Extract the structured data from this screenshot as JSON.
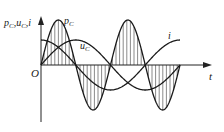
{
  "figure": {
    "y_axis_label": "p",
    "y_axis_label_sub1": "C",
    "y_axis_label_sep1": ",",
    "y_axis_label_u": "u",
    "y_axis_label_sub2": "C",
    "y_axis_label_sep2": ",",
    "y_axis_label_i": "i",
    "x_axis_label": "t",
    "origin_label": "O",
    "curve_labels": {
      "pc_main": "p",
      "pc_sub": "C",
      "uc_main": "u",
      "uc_sub": "C",
      "i": "i"
    },
    "colors": {
      "line": "#1a1a1a",
      "hatch": "#3a3a3a",
      "axis": "#222222"
    }
  },
  "chart_data": {
    "type": "line",
    "title": "",
    "xlabel": "t",
    "ylabel": "p_C, u_C, i",
    "series": [
      {
        "name": "p_C",
        "description": "instantaneous power, double frequency, hatched area between curve and t-axis",
        "function": "A_p * sin(2ωt)",
        "relative_amplitude": 1.8,
        "zero_crossings_in_periods_of_u": [
          0,
          0.25,
          0.5,
          0.75,
          1.0
        ]
      },
      {
        "name": "u_C",
        "description": "capacitor voltage",
        "function": "A * sin(ωt)",
        "relative_amplitude": 1.0,
        "x_range_periods": [
          0,
          1
        ]
      },
      {
        "name": "i",
        "description": "current, leads voltage by 90°",
        "function": "A * cos(ωt)",
        "relative_amplitude": 1.0,
        "x_range_periods": [
          0,
          1
        ]
      }
    ],
    "x_range_periods": [
      0,
      1
    ],
    "grid": false,
    "legend": "inline labels"
  }
}
